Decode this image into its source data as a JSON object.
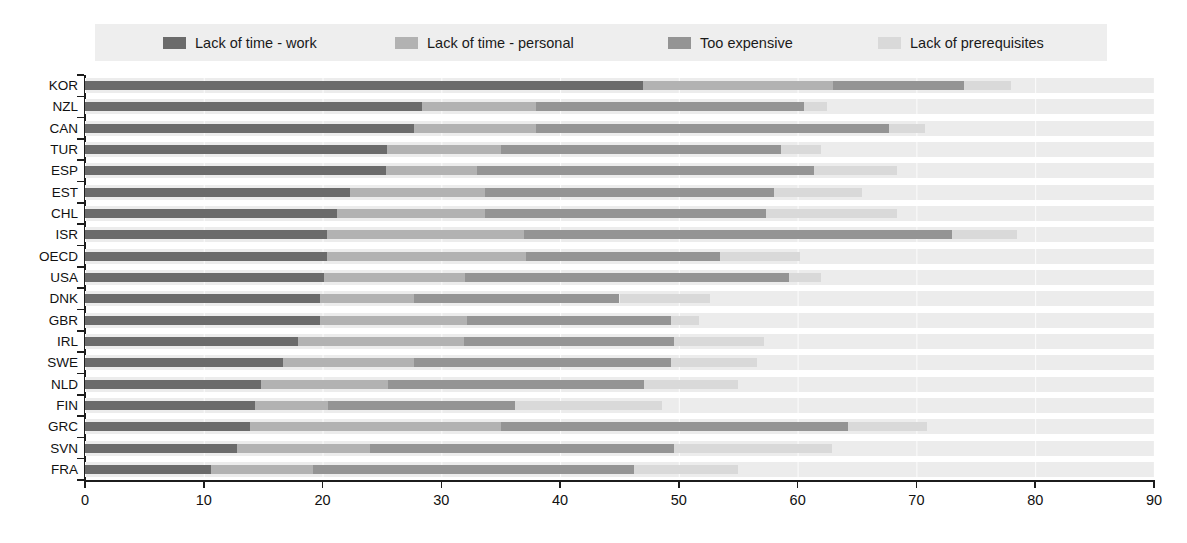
{
  "chart_data": {
    "type": "bar",
    "variant": "horizontal-stacked",
    "title": "",
    "xlabel": "",
    "ylabel": "",
    "xlim": [
      0,
      90
    ],
    "x_ticks": [
      0,
      10,
      20,
      30,
      40,
      50,
      60,
      70,
      80,
      90
    ],
    "grid": "vertical-white-on-row-bands",
    "legend_position": "top",
    "row_band_color": "#ececec",
    "legend_bg_color": "#eeeeee",
    "axis_color": "#1c1c1c",
    "categories": [
      "KOR",
      "NZL",
      "CAN",
      "TUR",
      "ESP",
      "EST",
      "CHL",
      "ISR",
      "OECD",
      "USA",
      "DNK",
      "GBR",
      "IRL",
      "SWE",
      "NLD",
      "FIN",
      "GRC",
      "SVN",
      "FRA"
    ],
    "series": [
      {
        "name": "Lack of time - work",
        "color": "#6b6b6b",
        "values": [
          47.0,
          28.4,
          27.7,
          25.4,
          25.3,
          22.3,
          21.2,
          20.4,
          20.4,
          20.1,
          19.8,
          19.8,
          17.9,
          16.7,
          14.8,
          14.3,
          13.9,
          12.8,
          10.6
        ]
      },
      {
        "name": "Lack of time - personal",
        "color": "#b2b2b2",
        "values": [
          16.0,
          9.6,
          10.3,
          9.6,
          7.7,
          11.4,
          12.5,
          16.6,
          16.7,
          11.9,
          7.9,
          12.4,
          14.0,
          11.0,
          10.7,
          6.2,
          21.1,
          11.2,
          8.6
        ]
      },
      {
        "name": "Too expensive",
        "color": "#949494",
        "values": [
          11.0,
          22.5,
          29.7,
          23.6,
          28.4,
          24.3,
          23.6,
          36.0,
          16.4,
          27.3,
          17.3,
          17.1,
          17.7,
          21.6,
          21.6,
          15.7,
          29.2,
          25.6,
          27.0
        ]
      },
      {
        "name": "Lack of prerequisites",
        "color": "#d9d9d9",
        "values": [
          4.0,
          2.0,
          3.0,
          3.4,
          7.0,
          7.4,
          11.1,
          5.5,
          6.7,
          2.7,
          7.6,
          2.4,
          7.6,
          7.3,
          7.9,
          12.4,
          6.7,
          13.3,
          8.8
        ]
      }
    ],
    "legend_item_offsets_px": [
      68,
      300,
      573,
      783
    ]
  }
}
